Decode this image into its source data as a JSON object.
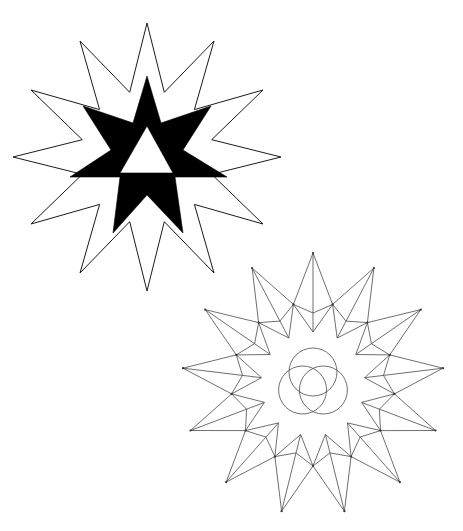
{
  "figure": {
    "background": "#ffffff",
    "stroke_color": "#1a1a1a",
    "fill_color": "#000000"
  },
  "star_top": {
    "label": "twelve-pointed outline star with black six-pointed star and white triangle",
    "center": [
      147,
      157
    ],
    "points": 12,
    "outer_radius": 134,
    "inner_radius": 67,
    "rotation_deg": 0,
    "black_star": {
      "vertices": [
        [
          147,
          76
        ],
        [
          161,
          123
        ],
        [
          211,
          106
        ],
        [
          183,
          150
        ],
        [
          227,
          177
        ],
        [
          175,
          177
        ],
        [
          183,
          233
        ],
        [
          147,
          195
        ],
        [
          113,
          233
        ],
        [
          120,
          177
        ],
        [
          70,
          177
        ],
        [
          111,
          150
        ],
        [
          83,
          106
        ],
        [
          133,
          123
        ]
      ]
    },
    "white_triangle": {
      "vertices": [
        [
          147,
          126
        ],
        [
          173,
          173
        ],
        [
          120,
          173
        ]
      ]
    }
  },
  "star_bottom": {
    "label": "thirteen-pointed line-construction star with trefoil center",
    "center": [
      313,
      384
    ],
    "points": 13,
    "tip_radius": 131,
    "junction_radius": 82,
    "kink_radius": 71,
    "core_radius": 52,
    "rotation_deg": 0,
    "trefoil": {
      "circle_radius": 24,
      "offset": 12
    }
  }
}
